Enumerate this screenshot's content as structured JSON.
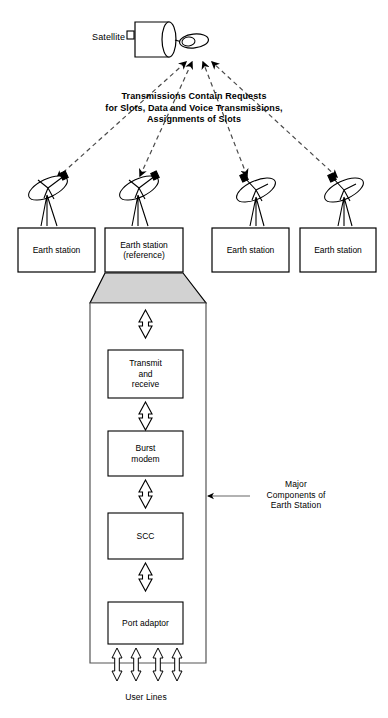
{
  "figure": {
    "satellite": {
      "label": "Satellite",
      "icon": "satellite-icon"
    },
    "uplink_note": "Transmissions Contain Requests\nfor Slots, Data and Voice Transmissions,\nAssignments of Slots",
    "earth_stations": [
      {
        "label": "Earth station",
        "reference": false
      },
      {
        "label": "Earth station\n(reference)",
        "reference": true
      },
      {
        "label": "Earth station",
        "reference": false
      },
      {
        "label": "Earth station",
        "reference": false
      }
    ],
    "components": [
      {
        "label": "Transmit\nand\nreceive"
      },
      {
        "label": "Burst\nmodem"
      },
      {
        "label": "SCC"
      },
      {
        "label": "Port adaptor"
      }
    ],
    "callout": "Major\nComponents of\nEarth Station",
    "user_lines_label": "User Lines",
    "colors": {
      "stroke": "#000000",
      "trapezoid_fill": "#d2d2d2",
      "box_fill": "#ffffff",
      "background": "#ffffff",
      "dashed_link": "#4a4a4a"
    }
  }
}
